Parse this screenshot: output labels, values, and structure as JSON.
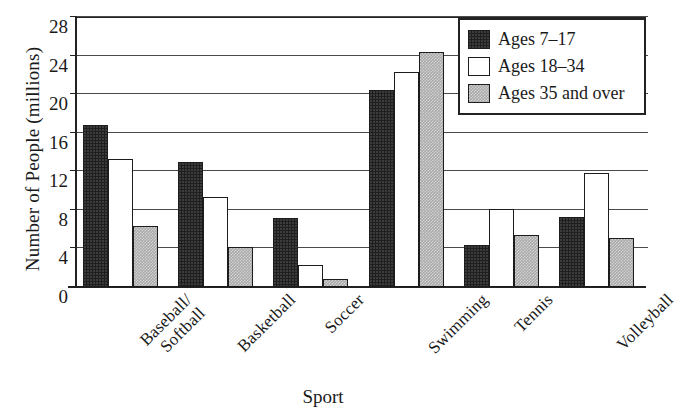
{
  "chart_data": {
    "type": "bar",
    "title": "",
    "xlabel": "Sport",
    "ylabel": "Number of People (millions)",
    "categories": [
      "Baseball/\nSoftball",
      "Basketball",
      "Soccer",
      "Swimming",
      "Tennis",
      "Volleyball"
    ],
    "series": [
      {
        "name": "Ages 7–17",
        "values": [
          16.8,
          13.0,
          7.2,
          20.4,
          4.4,
          7.3
        ]
      },
      {
        "name": "Ages 18–34",
        "values": [
          13.3,
          9.3,
          2.3,
          22.3,
          8.1,
          11.8
        ]
      },
      {
        "name": "Ages 35 and over",
        "values": [
          6.3,
          4.1,
          0.8,
          24.4,
          5.4,
          5.1
        ]
      }
    ],
    "ylim": [
      0,
      28
    ],
    "yticks": [
      0,
      4,
      8,
      12,
      16,
      20,
      24,
      28
    ],
    "ytick_labels": [
      "0",
      "4",
      "8",
      "12",
      "16",
      "20",
      "24",
      "28"
    ],
    "grid": true,
    "legend_position": "upper right",
    "series_colors": [
      "#1f1f1f",
      "#ffffff",
      "#a9a9a9"
    ]
  },
  "legend": {
    "entries": [
      {
        "label": "Ages 7–17"
      },
      {
        "label": "Ages 18–34"
      },
      {
        "label": "Ages 35 and over"
      }
    ]
  }
}
